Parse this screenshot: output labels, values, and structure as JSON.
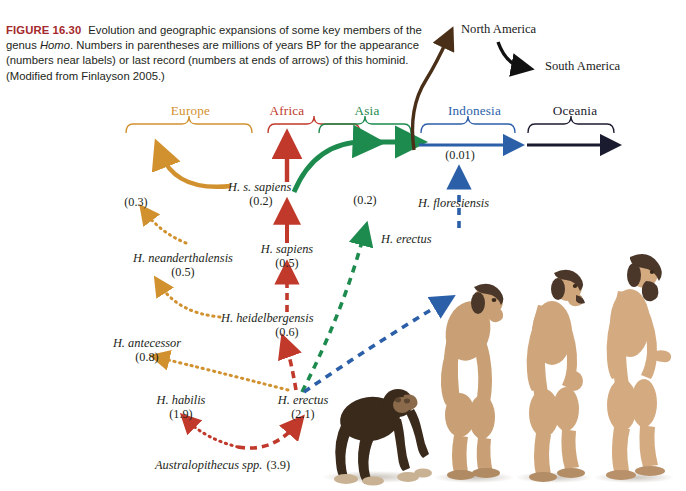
{
  "figure": {
    "number": "FIGURE 16.30",
    "caption_parts": [
      "Evolution and geographic expansions of some key members of the genus ",
      "Homo",
      ". Numbers in parentheses are millions of years BP for the appearance (numbers near labels) or last record (numbers at ends of arrows) of this hominid. (Modified from Finlayson 2005.)"
    ]
  },
  "colors": {
    "europe": "#d2912f",
    "africa": "#c0392b",
    "asia": "#1d8a4e",
    "indonesia": "#2b5fa8",
    "oceania": "#1b1b2f",
    "americas": "#5a3a1e",
    "figure_number": "#a4282c",
    "text": "#231f20"
  },
  "regions": [
    {
      "name": "Europe",
      "label": "Europe",
      "color": "#d2912f"
    },
    {
      "name": "Africa",
      "label": "Africa",
      "color": "#c0392b"
    },
    {
      "name": "Asia",
      "label": "Asia",
      "color": "#1d8a4e"
    },
    {
      "name": "Indonesia",
      "label": "Indonesia",
      "color": "#2b5fa8"
    },
    {
      "name": "Oceania",
      "label": "Oceania",
      "color": "#1b1b2f"
    }
  ],
  "destinations": [
    {
      "label": "North America",
      "color": "#231f20"
    },
    {
      "label": "South America",
      "color": "#231f20"
    }
  ],
  "taxa": [
    {
      "name": "H. s. sapiens",
      "date": "(0.2)",
      "color": "#231f20",
      "region": "Africa"
    },
    {
      "name": "H. sapiens",
      "date": "(0.5)",
      "color": "#231f20",
      "region": "Africa"
    },
    {
      "name": "H. heidelbergensis",
      "date": "(0.6)",
      "color": "#231f20",
      "region": "Africa"
    },
    {
      "name": "H. neanderthalensis",
      "date": "(0.5)",
      "color": "#231f20",
      "region": "Europe"
    },
    {
      "name": "H. antecessor",
      "date": "(0.8)",
      "color": "#231f20",
      "region": "Europe"
    },
    {
      "name": "H. habilis",
      "date": "(1.9)",
      "color": "#231f20",
      "region": "Africa"
    },
    {
      "name": "H. erectus",
      "date": "(2.1)",
      "color": "#231f20",
      "region": "Africa"
    },
    {
      "name": "H. erectus",
      "date": "(0.2)",
      "color": "#231f20",
      "region": "Asia"
    },
    {
      "name": "H. floresiensis",
      "date": "(0.01)",
      "color": "#231f20",
      "region": "Indonesia"
    },
    {
      "name": "Australopithecus spp.",
      "date": "(3.9)",
      "color": "#231f20",
      "region": "Africa"
    }
  ],
  "last_record_numbers": [
    {
      "value": "(0.3)",
      "taxon": "H. neanderthalensis"
    },
    {
      "value": "(0.2)",
      "taxon": "H. erectus"
    },
    {
      "value": "(0.01)",
      "taxon": "H. floresiensis"
    }
  ],
  "labels": {
    "europe": "Europe",
    "africa": "Africa",
    "asia": "Asia",
    "indonesia": "Indonesia",
    "oceania": "Oceania",
    "north_america": "North America",
    "south_america": "South America",
    "hss_name": "H. s. sapiens",
    "hss_date": "(0.2)",
    "hsap_name": "H. sapiens",
    "hsap_date": "(0.5)",
    "hheid_name": "H. heidelbergensis",
    "hheid_date": "(0.6)",
    "hnean_name": "H. neanderthalensis",
    "hnean_date": "(0.5)",
    "hnean_last": "(0.3)",
    "hante_name": "H. antecessor",
    "hante_date": "(0.8)",
    "hhab_name": "H. habilis",
    "hhab_date": "(1.9)",
    "herec_name": "H. erectus",
    "herec_date": "(2.1)",
    "herec_asia_name": "H. erectus",
    "herec_asia_last": "(0.2)",
    "hflor_name": "H. floresiensis",
    "hflor_last": "(0.01)",
    "austro_name": "Australopithecus spp.",
    "austro_date": "(3.9)"
  },
  "hominid_illustration": {
    "count": 4,
    "figures": [
      "knuckle-walking ape",
      "early hominin",
      "intermediate hominin",
      "modern human"
    ]
  }
}
